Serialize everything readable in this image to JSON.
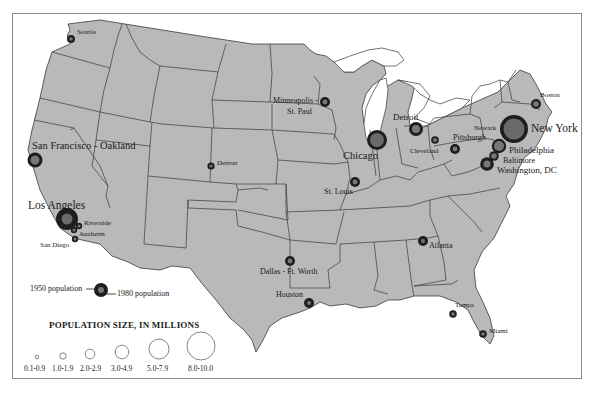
{
  "map": {
    "subject": "Metropolitan area population, United States, 1950 and 1980",
    "land_color": "#b9b9b9",
    "water_color": "#ffffff",
    "border_color": "#3a3a3a",
    "circle_1980_color": "#1e1e1e",
    "circle_1950_color": "#777777"
  },
  "cities": [
    {
      "name": "Seattle",
      "label": "Seattle"
    },
    {
      "name": "San Francisco - Oakland",
      "label": "San Francisco - Oakland"
    },
    {
      "name": "Los Angeles",
      "label": "Los Angeles"
    },
    {
      "name": "Riverside",
      "label": "Riverside"
    },
    {
      "name": "Anaheim",
      "label": "Anaheim"
    },
    {
      "name": "San Diego",
      "label": "San Diego"
    },
    {
      "name": "Denver",
      "label": "Denver"
    },
    {
      "name": "Minneapolis - St. Paul",
      "label_line1": "Minneapolis -",
      "label_line2": "St. Paul"
    },
    {
      "name": "Chicago",
      "label": "Chicago"
    },
    {
      "name": "St. Louis",
      "label": "St. Louis"
    },
    {
      "name": "Detroit",
      "label": "Detroit"
    },
    {
      "name": "Cleveland",
      "label": "Cleveland"
    },
    {
      "name": "Pittsburgh",
      "label": "Pittsburgh"
    },
    {
      "name": "Boston",
      "label": "Boston"
    },
    {
      "name": "Newark",
      "label": "Newark"
    },
    {
      "name": "New York",
      "label": "New York"
    },
    {
      "name": "Philadelphia",
      "label": "Philadelphia"
    },
    {
      "name": "Baltimore",
      "label": "Baltimore"
    },
    {
      "name": "Washington, DC",
      "label": "Washington, DC"
    },
    {
      "name": "Atlanta",
      "label": "Atlanta"
    },
    {
      "name": "Dallas - Ft. Worth",
      "label": "Dallas - Ft. Worth"
    },
    {
      "name": "Houston",
      "label": "Houston"
    },
    {
      "name": "Tampa",
      "label": "Tampa"
    },
    {
      "name": "Miami",
      "label": "Miami"
    }
  ],
  "legend": {
    "example_1950": "1950 population",
    "example_1980": "1980 population",
    "title": "POPULATION SIZE, IN MILLIONS",
    "sizes": [
      {
        "range": "0.1-0.9"
      },
      {
        "range": "1.0-1.9"
      },
      {
        "range": "2.0-2.9"
      },
      {
        "range": "3.0-4.9"
      },
      {
        "range": "5.0-7.9"
      },
      {
        "range": "8.0-10.0"
      }
    ]
  }
}
